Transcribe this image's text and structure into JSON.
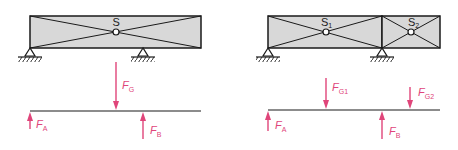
{
  "colors": {
    "beam_fill": "#d8d8d8",
    "line": "#1a1a1a",
    "force": "#e0457a"
  },
  "left_diagram": {
    "beam": {
      "center_label": "S"
    },
    "forces": {
      "weight": {
        "symbol": "F",
        "sub": "G"
      },
      "support_a": {
        "symbol": "F",
        "sub": "A"
      },
      "support_b": {
        "symbol": "F",
        "sub": "B"
      }
    }
  },
  "right_diagram": {
    "beam": {
      "segment1_label": {
        "symbol": "S",
        "sub": "1"
      },
      "segment2_label": {
        "symbol": "S",
        "sub": "2"
      }
    },
    "forces": {
      "weight1": {
        "symbol": "F",
        "sub": "G1"
      },
      "weight2": {
        "symbol": "F",
        "sub": "G2"
      },
      "support_a": {
        "symbol": "F",
        "sub": "A"
      },
      "support_b": {
        "symbol": "F",
        "sub": "B"
      }
    }
  }
}
